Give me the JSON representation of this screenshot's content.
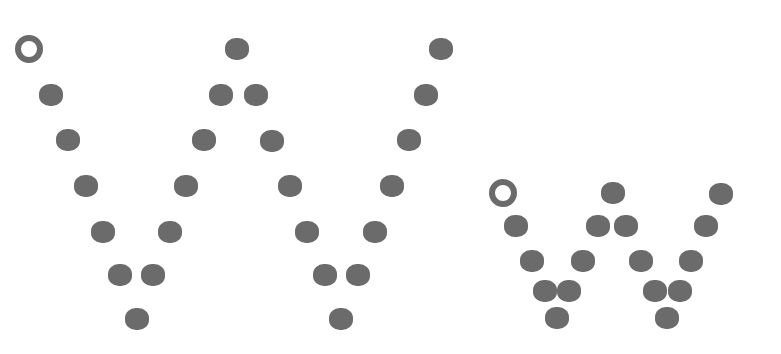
{
  "figure": {
    "dot_color": "#6b6b6b",
    "ring_color": "#6b6b6b",
    "background": "#ffffff"
  },
  "glyphs": [
    {
      "name": "large-w",
      "dot_w": 24,
      "dot_h": 22,
      "ring": {
        "x": 29,
        "y": 49,
        "size": 28,
        "stroke": 6
      },
      "dots": [
        {
          "x": 237,
          "y": 49
        },
        {
          "x": 441,
          "y": 49
        },
        {
          "x": 51,
          "y": 95
        },
        {
          "x": 221,
          "y": 95
        },
        {
          "x": 256,
          "y": 95
        },
        {
          "x": 426,
          "y": 95
        },
        {
          "x": 68,
          "y": 140
        },
        {
          "x": 204,
          "y": 140
        },
        {
          "x": 272,
          "y": 141
        },
        {
          "x": 409,
          "y": 140
        },
        {
          "x": 86,
          "y": 186
        },
        {
          "x": 186,
          "y": 186
        },
        {
          "x": 290,
          "y": 186
        },
        {
          "x": 392,
          "y": 186
        },
        {
          "x": 103,
          "y": 232
        },
        {
          "x": 170,
          "y": 232
        },
        {
          "x": 307,
          "y": 232
        },
        {
          "x": 375,
          "y": 232
        },
        {
          "x": 120,
          "y": 275
        },
        {
          "x": 153,
          "y": 275
        },
        {
          "x": 325,
          "y": 275
        },
        {
          "x": 358,
          "y": 275
        },
        {
          "x": 137,
          "y": 319
        },
        {
          "x": 341,
          "y": 319
        }
      ]
    },
    {
      "name": "small-w",
      "dot_w": 24,
      "dot_h": 22,
      "ring": {
        "x": 503,
        "y": 193,
        "size": 28,
        "stroke": 6
      },
      "dots": [
        {
          "x": 613,
          "y": 193
        },
        {
          "x": 721,
          "y": 194
        },
        {
          "x": 516,
          "y": 226
        },
        {
          "x": 598,
          "y": 226
        },
        {
          "x": 626,
          "y": 226
        },
        {
          "x": 706,
          "y": 226
        },
        {
          "x": 532,
          "y": 261
        },
        {
          "x": 583,
          "y": 261
        },
        {
          "x": 641,
          "y": 261
        },
        {
          "x": 691,
          "y": 261
        },
        {
          "x": 545,
          "y": 291
        },
        {
          "x": 569,
          "y": 291
        },
        {
          "x": 655,
          "y": 291
        },
        {
          "x": 680,
          "y": 291
        },
        {
          "x": 557,
          "y": 318
        },
        {
          "x": 667,
          "y": 318
        }
      ]
    }
  ]
}
